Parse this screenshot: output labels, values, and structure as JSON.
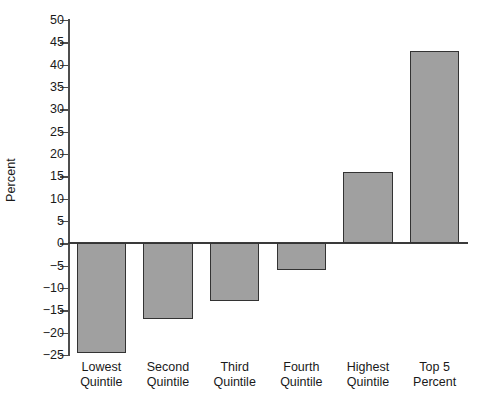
{
  "chart_data": {
    "type": "bar",
    "title": "",
    "xlabel": "",
    "ylabel": "Percent",
    "categories": [
      "Lowest Quintile",
      "Second Quintile",
      "Third Quintile",
      "Fourth Quintile",
      "Highest Quintile",
      "Top 5 Percent"
    ],
    "category_lines": [
      [
        "Lowest",
        "Quintile"
      ],
      [
        "Second",
        "Quintile"
      ],
      [
        "Third",
        "Quintile"
      ],
      [
        "Fourth",
        "Quintile"
      ],
      [
        "Highest",
        "Quintile"
      ],
      [
        "Top 5",
        "Percent"
      ]
    ],
    "values": [
      -24.5,
      -17,
      -13,
      -6,
      16,
      43
    ],
    "ylim": [
      -25,
      50
    ],
    "ytick_step": 5,
    "yticks": [
      50,
      45,
      40,
      35,
      30,
      25,
      20,
      15,
      10,
      5,
      0,
      -5,
      -10,
      -15,
      -20,
      -25
    ],
    "ytick_labels": [
      "50",
      "45",
      "40",
      "35",
      "30",
      "25",
      "20",
      "15",
      "10",
      "5",
      "0",
      "−5",
      "−10",
      "−15",
      "−20",
      "−25"
    ],
    "grid": false,
    "legend": null,
    "bar_fill_color": "#a0a0a0",
    "bar_edge_color": "#333333",
    "axis_color": "#4d4d4d",
    "background_color": "#ffffff"
  }
}
